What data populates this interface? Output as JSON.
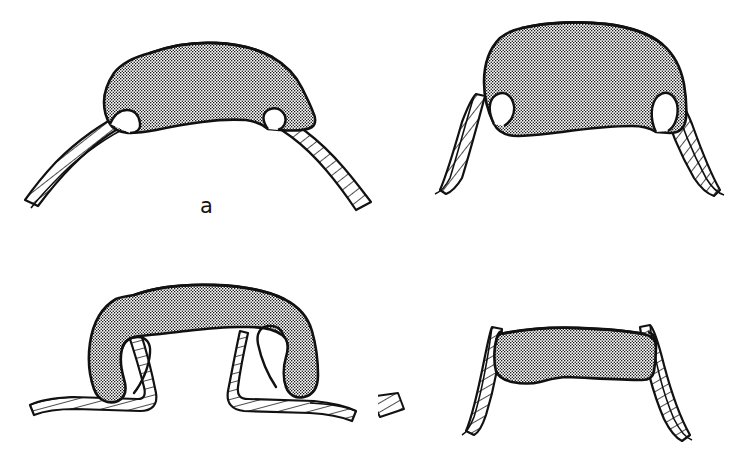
{
  "figure": {
    "type": "scientific-line-drawing",
    "background_color": "#ffffff",
    "ink_color": "#111111",
    "panel_count": 4,
    "caption_note": "Four schematic sections, each showing a stippled mass articulating with two hatched bands",
    "panels": [
      {
        "id": "a",
        "label": "a",
        "description": "Wide, low dome-shaped stippled mass; hatched bands sweep outward and downward in shallow curves",
        "mass_shape": "low broad dome",
        "band_angle": "shallow / splayed",
        "fill": "stipple",
        "band_fill": "diagonal-hatch"
      },
      {
        "id": "b",
        "label": "b",
        "description": "Tall rounded rectangular stippled mass with square shoulders; hatched bands descend steeply with slight outward flare",
        "mass_shape": "tall rounded block",
        "band_angle": "steep / slightly flared",
        "fill": "stipple",
        "band_fill": "diagonal-hatch"
      },
      {
        "id": "c",
        "label": "c",
        "description": "Flat arched stippled bridge whose ends curl down and hook around the hatched bands; bands run outward nearly horizontally",
        "mass_shape": "flat arch with hooked ends",
        "band_angle": "near-horizontal / outward",
        "fill": "stipple",
        "band_fill": "diagonal-hatch"
      },
      {
        "id": "d",
        "label": "d",
        "description": "Straight flat stippled bar spanning between two nearly vertical hatched bands",
        "mass_shape": "straight flat bar",
        "band_angle": "near-vertical",
        "fill": "stipple",
        "band_fill": "diagonal-hatch"
      }
    ],
    "labels": {
      "a": "a",
      "b": "b",
      "c": "c",
      "d": "d"
    }
  }
}
